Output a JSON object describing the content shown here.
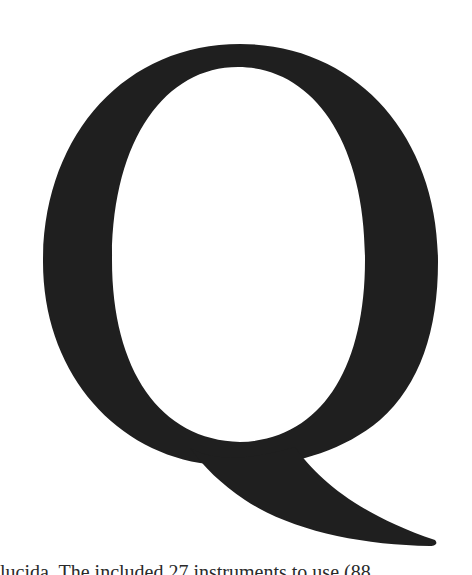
{
  "figure": {
    "glyph": "Q",
    "glyph_color": "#1f1f1f",
    "background_color": "#ffffff"
  },
  "caption": {
    "text": "lucida. The included 27 instruments to use (88"
  }
}
